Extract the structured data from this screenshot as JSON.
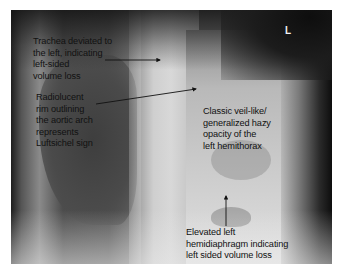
{
  "image": {
    "type": "chest-xray-annotated",
    "side_marker": "L"
  },
  "annotations": [
    {
      "id": "trachea",
      "text": "Trachea deviated to\nthe left, indicating\nleft-sided\nvolume loss"
    },
    {
      "id": "luftsichel",
      "text": "Radiolucent\nrim outlining\nthe aortic arch\nrepresents\nLuftsichel sign"
    },
    {
      "id": "veil",
      "text": "Classic veil-like/\ngeneralized hazy\nopacity of the\nleft hemithorax"
    },
    {
      "id": "hemidiaphragm",
      "text": "Elevated left\nhemidiaphragm indicating\nleft sided volume loss"
    }
  ]
}
